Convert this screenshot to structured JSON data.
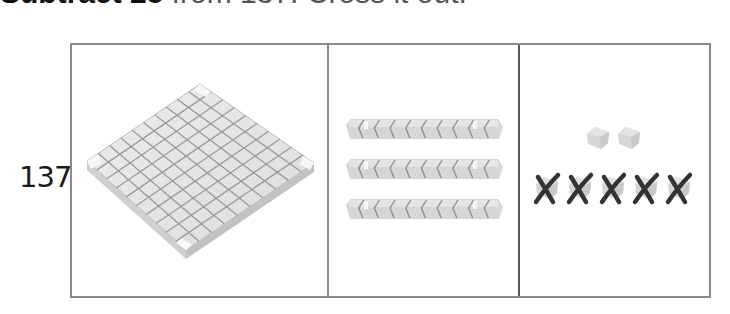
{
  "heading": {
    "bold_text": "Subtract 25",
    "rest_text": " from 137. Cross it out."
  },
  "problem": {
    "number": "137"
  },
  "place_value": {
    "hundreds": {
      "count": 1,
      "label": "hundreds-flat"
    },
    "tens": {
      "count": 3,
      "label": "tens-rods"
    },
    "ones": {
      "total": 7,
      "remaining": 2,
      "crossed_out": 5
    }
  },
  "colors": {
    "block_fill": "#d9d9d9",
    "block_top": "#e6e6e6",
    "block_grid": "#9a9a9a",
    "frame_border": "#8a8a8a",
    "cross_mark": "#333333"
  }
}
